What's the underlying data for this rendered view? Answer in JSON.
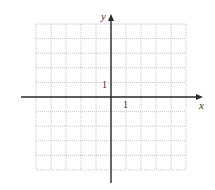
{
  "diagram": {
    "type": "coordinate-plane",
    "grid": {
      "left": 36,
      "right": 186,
      "top": 24,
      "bottom": 170,
      "columns": 10,
      "rows": 10,
      "style": "dotted",
      "color": "#b8b8b8"
    },
    "axes": {
      "color": "#2a2a2a",
      "origin": {
        "x": 111,
        "y": 97
      },
      "x_axis": {
        "from": 21,
        "to": 203,
        "label": "x"
      },
      "y_axis": {
        "from": 183,
        "to": 14,
        "label": "y"
      }
    },
    "tick_labels": {
      "x_unit": "1",
      "y_unit": "1"
    }
  }
}
